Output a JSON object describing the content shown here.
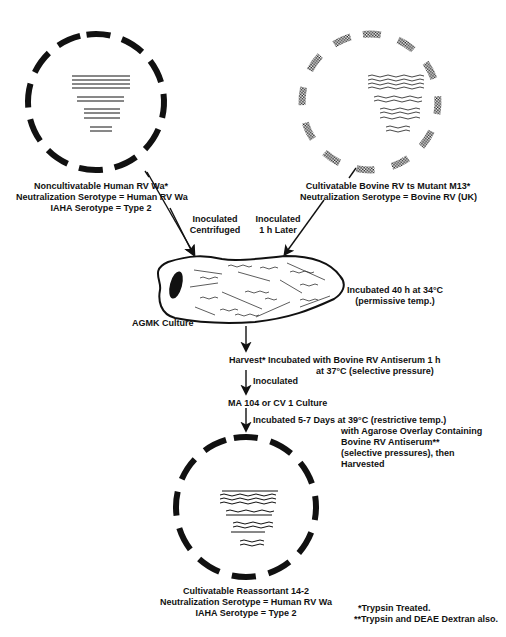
{
  "virus_left": {
    "name": "Noncultivatable Human RV Wa*",
    "neutralization": "Neutralization Serotype = Human RV Wa",
    "iaha": "IAHA  Serotype = Type 2"
  },
  "virus_right": {
    "name": "Cultivatable Bovine RV ts Mutant M13*",
    "neutralization": "Neutralization Serotype = Bovine RV (UK)"
  },
  "arrows": {
    "left_line1": "Inoculated",
    "left_line2": "Centrifuged",
    "right_line1": "Inoculated",
    "right_line2": "1 h  Later"
  },
  "culture": {
    "label": "AGMK Culture",
    "incubation_line1": "Incubated 40 h  at 34°C",
    "incubation_line2": "(permissive temp.)"
  },
  "harvest": {
    "line1": "Harvest* Incubated with Bovine RV Antiserum 1 h",
    "line2": "at 37°C (selective pressure)"
  },
  "step_inoculated": "Inoculated",
  "second_culture": "MA 104 or CV 1 Culture",
  "incubation2": {
    "line1": "Incubated 5-7 Days at 39°C (restrictive temp.)",
    "line2": "with Agarose Overlay Containing",
    "line3": "Bovine RV Antiserum**",
    "line4": "(selective pressures), then",
    "line5": "Harvested"
  },
  "result_virus": {
    "name": "Cultivatable Reassortant 14-2",
    "neutralization": "Neutralization Serotype = Human RV Wa",
    "iaha": "IAHA  Serotype = Type 2"
  },
  "footnotes": {
    "note1": "*Trypsin Treated.",
    "note2": "**Trypsin and DEAE Dextran also."
  },
  "segments": [
    "1",
    "2",
    "3",
    "4",
    "5",
    "6",
    "7",
    "8",
    "9",
    "10",
    "11"
  ]
}
